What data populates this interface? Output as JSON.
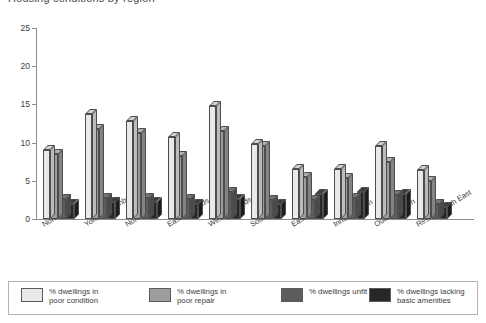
{
  "title": "Housing conditions by region",
  "chart_data": {
    "type": "bar",
    "title": "Housing conditions by region",
    "xlabel": "",
    "ylabel": "",
    "ylim": [
      0,
      25
    ],
    "yticks": [
      0,
      5,
      10,
      15,
      20,
      25
    ],
    "ytick_labels": [
      "0",
      "5",
      "10",
      "15",
      "20",
      "25"
    ],
    "grid": false,
    "legend_position": "bottom",
    "style": "3d-grouped-bar",
    "categories": [
      "Northern",
      "Yorks &\nHumberside",
      "North West",
      "East\nMidlands",
      "West\nMidlands",
      "South\nWest",
      "East\nAnglia",
      "Inner\nLondon",
      "Outer\nLondon",
      "Rest of\nSouth East"
    ],
    "series": [
      {
        "name": "% dwellings in\npoor condition",
        "color": "#e9e9e9",
        "top_color": "#d2d2d2",
        "side_color": "#bcbcbc",
        "values": [
          9.0,
          13.8,
          12.8,
          10.8,
          14.8,
          9.8,
          6.6,
          6.6,
          9.5,
          6.4
        ]
      },
      {
        "name": "% dwellings in\npoor repair",
        "color": "#9d9d9d",
        "top_color": "#b4b4b4",
        "side_color": "#848484",
        "values": [
          8.5,
          11.8,
          11.3,
          8.3,
          11.5,
          9.5,
          5.5,
          5.4,
          7.5,
          5.0
        ]
      },
      {
        "name": "% dwellings unfit",
        "color": "#5d5d5d",
        "top_color": "#757575",
        "side_color": "#4a4a4a",
        "values": [
          2.6,
          2.8,
          2.8,
          2.6,
          3.5,
          2.5,
          2.5,
          2.8,
          3.2,
          1.9
        ]
      },
      {
        "name": "% dwellings lacking\nbasic amenities",
        "color": "#272727",
        "top_color": "#3d3d3d",
        "side_color": "#1c1c1c",
        "values": [
          2.0,
          2.2,
          2.2,
          2.0,
          2.6,
          1.9,
          3.3,
          3.5,
          3.3,
          1.6
        ]
      }
    ]
  },
  "legend": {
    "items": [
      {
        "label": "% dwellings in\npoor condition",
        "color": "#e9e9e9"
      },
      {
        "label": "% dwellings in\npoor repair",
        "color": "#9d9d9d"
      },
      {
        "label": "% dwellings unfit",
        "color": "#5d5d5d"
      },
      {
        "label": "% dwellings lacking\nbasic amenities",
        "color": "#272727"
      }
    ]
  }
}
